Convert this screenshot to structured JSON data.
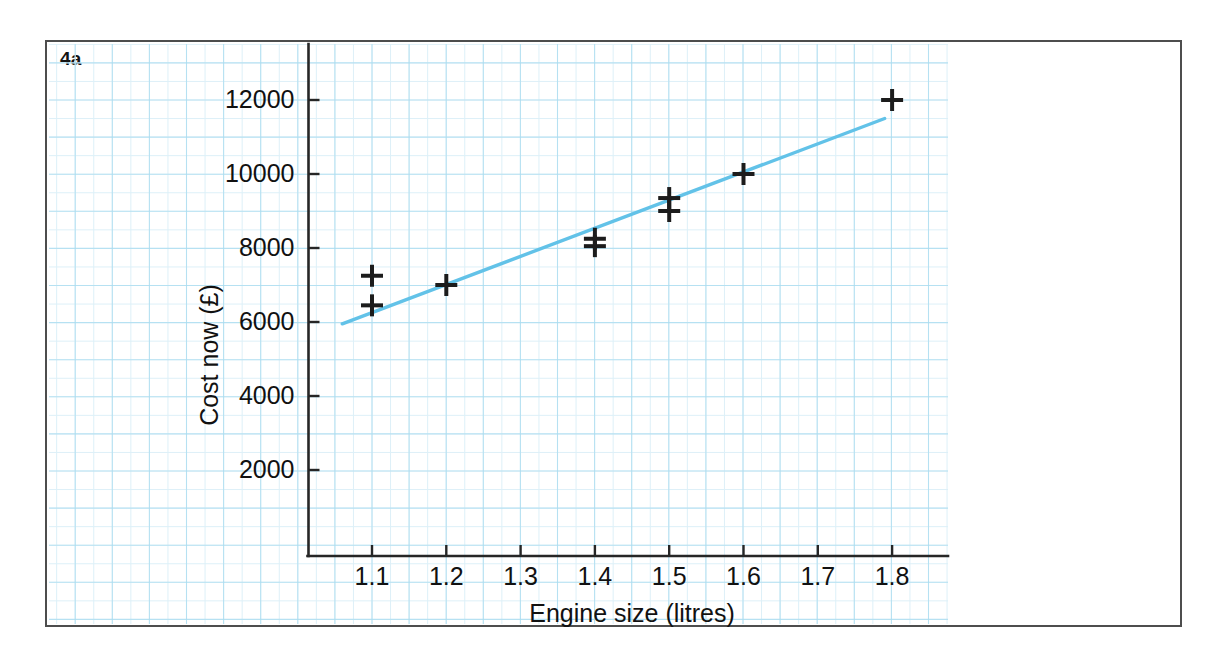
{
  "figure": {
    "label": "4a",
    "border_color": "#4d4d4d",
    "background": "#ffffff"
  },
  "chart_data": {
    "type": "scatter",
    "title": "",
    "xlabel": "Engine size (litres)",
    "ylabel": "Cost now (£)",
    "xlim": [
      1.04,
      1.86
    ],
    "ylim": [
      0,
      13000
    ],
    "xticks": [
      1.1,
      1.2,
      1.3,
      1.4,
      1.5,
      1.6,
      1.7,
      1.8
    ],
    "xtick_labels": [
      "1.1",
      "1.2",
      "1.3",
      "1.4",
      "1.5",
      "1.6",
      "1.7",
      "1.8"
    ],
    "yticks": [
      2000,
      4000,
      6000,
      8000,
      10000,
      12000
    ],
    "ytick_labels": [
      "2000",
      "4000",
      "6000",
      "8000",
      "10000",
      "12000"
    ],
    "grid": "graph-paper light blue, major squares",
    "grid_color": "#a9dcf0",
    "grid_minor_color": "#ddf0f8",
    "legend": "none",
    "marker": "plus",
    "marker_color": "#1c1c1c",
    "points": [
      {
        "x": 1.1,
        "y": 7250
      },
      {
        "x": 1.1,
        "y": 6450
      },
      {
        "x": 1.2,
        "y": 7000
      },
      {
        "x": 1.4,
        "y": 8250
      },
      {
        "x": 1.4,
        "y": 8050
      },
      {
        "x": 1.5,
        "y": 9350
      },
      {
        "x": 1.5,
        "y": 9000
      },
      {
        "x": 1.6,
        "y": 10000
      },
      {
        "x": 1.8,
        "y": 12000
      }
    ],
    "series": [
      {
        "name": "line of best fit",
        "type": "line",
        "color": "#62c2e8",
        "x": [
          1.06,
          1.79
        ],
        "y": [
          5950,
          11500
        ]
      }
    ]
  }
}
